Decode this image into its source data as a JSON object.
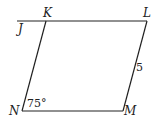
{
  "diagram": {
    "type": "parallelogram",
    "vertices": {
      "K": {
        "label": "K",
        "x": 46,
        "y": 21
      },
      "L": {
        "label": "L",
        "x": 147,
        "y": 21
      },
      "M": {
        "label": "M",
        "x": 123,
        "y": 111
      },
      "N": {
        "label": "N",
        "x": 22,
        "y": 111
      }
    },
    "extension_point": {
      "label": "J",
      "x": 17,
      "y": 21
    },
    "angle_label": "75°",
    "side_label": "5",
    "line_color": "#222222"
  }
}
